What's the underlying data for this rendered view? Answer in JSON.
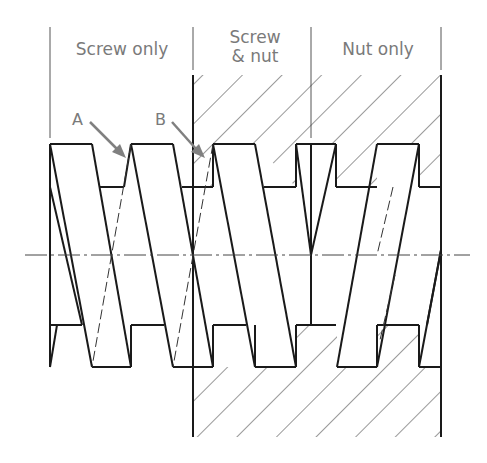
{
  "diagram": {
    "type": "screw-thread-engagement-section",
    "zones": [
      {
        "label": "Screw only"
      },
      {
        "label_line1": "Screw",
        "label_line2": "& nut"
      },
      {
        "label": "Nut only"
      }
    ],
    "callouts": [
      {
        "label": "A"
      },
      {
        "label": "B"
      }
    ],
    "colors": {
      "line": "#1a1a1a",
      "label": "#7a7a7a",
      "arrow": "#808080",
      "hatch": "#333333"
    }
  }
}
